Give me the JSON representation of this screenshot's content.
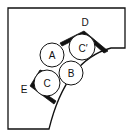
{
  "diagram": {
    "type": "geometric-packing",
    "circles": [
      {
        "label": "A",
        "cx": 52,
        "cy": 55,
        "r": 12
      },
      {
        "label": "C′",
        "cx": 82,
        "cy": 47,
        "r": 13
      },
      {
        "label": "B",
        "cx": 71,
        "cy": 73,
        "r": 12
      },
      {
        "label": "C",
        "cx": 47,
        "cy": 83,
        "r": 13
      }
    ],
    "vertices": [
      {
        "label": "D",
        "x": 85,
        "y": 23
      },
      {
        "label": "E",
        "x": 24,
        "y": 90
      }
    ],
    "colors": {
      "stroke": "#111111",
      "background": "#ffffff"
    }
  }
}
